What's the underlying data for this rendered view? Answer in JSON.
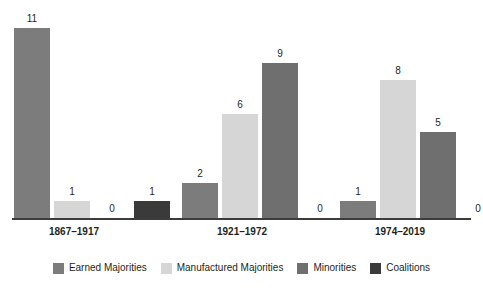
{
  "chart_data": {
    "type": "bar",
    "title": "",
    "subtitle": "",
    "xlabel": "",
    "ylabel": "",
    "ylim": [
      0,
      11
    ],
    "grid": false,
    "legend_position": "bottom",
    "categories": [
      "1867–1917",
      "1921–1972",
      "1974–2019"
    ],
    "series": [
      {
        "name": "Earned Majorities",
        "color": "#7c7c7c",
        "values": [
          11,
          2,
          1
        ]
      },
      {
        "name": "Manufactured Majorities",
        "color": "#d6d6d6",
        "values": [
          1,
          6,
          8
        ]
      },
      {
        "name": "Minorities",
        "color": "#6f6f6f",
        "values": [
          0,
          9,
          5
        ]
      },
      {
        "name": "Coalitions",
        "color": "#3a3a3a",
        "values": [
          1,
          0,
          0
        ]
      }
    ],
    "value_labels": [
      [
        "11",
        "1",
        "0",
        "1"
      ],
      [
        "2",
        "6",
        "9",
        "0"
      ],
      [
        "1",
        "8",
        "5",
        "0"
      ]
    ],
    "axis_color": "#3c3c3c"
  },
  "legend": {
    "items": [
      {
        "label": "Earned Majorities",
        "color": "#7c7c7c"
      },
      {
        "label": "Manufactured Majorities",
        "color": "#d6d6d6"
      },
      {
        "label": "Minorities",
        "color": "#6f6f6f"
      },
      {
        "label": "Coalitions",
        "color": "#3a3a3a"
      }
    ]
  }
}
